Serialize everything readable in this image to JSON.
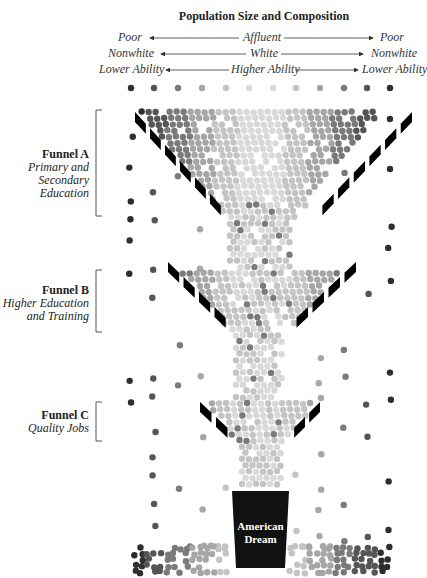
{
  "title": "Population Size and Composition",
  "axes": [
    {
      "left": "Poor",
      "center": "Affluent",
      "right": "Poor"
    },
    {
      "left": "Nonwhite",
      "center": "White",
      "right": "Nonwhite"
    },
    {
      "left": "Lower Ability",
      "center": "Higher Ability",
      "right": "Lower Ability"
    }
  ],
  "funnels": [
    {
      "name": "Funnel A",
      "desc_lines": [
        "Primary and",
        "Secondary",
        "Education"
      ]
    },
    {
      "name": "Funnel B",
      "desc_lines": [
        "Higher Education",
        "and Training"
      ]
    },
    {
      "name": "Funnel C",
      "desc_lines": [
        "Quality Jobs"
      ]
    }
  ],
  "cup": {
    "line1": "American",
    "line2": "Dream"
  },
  "colors": {
    "dark": "#2e2e2e",
    "mid_dark": "#555555",
    "mid": "#7a7a7a",
    "light": "#a6a6a6",
    "lighter": "#c4c4c4",
    "lightest": "#d9d9d9",
    "funnel_edge": "#000000",
    "cup": "#111111"
  },
  "top_row_shades": [
    "#2e2e2e",
    "#555555",
    "#7a7a7a",
    "#a6a6a6",
    "#c4c4c4",
    "#d9d9d9",
    "#d9d9d9",
    "#c4c4c4",
    "#a6a6a6",
    "#7a7a7a",
    "#555555",
    "#2e2e2e"
  ]
}
